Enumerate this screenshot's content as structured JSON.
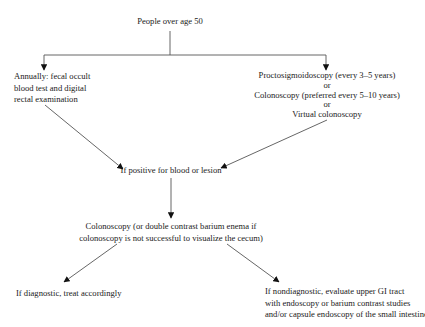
{
  "diagram": {
    "type": "flowchart",
    "colors": {
      "background": "#ffffff",
      "text": "#1a1a1a",
      "edge": "#555555",
      "arrowhead": "#111111"
    },
    "nodes": {
      "root": {
        "lines": [
          "People over age 50"
        ]
      },
      "annual": {
        "lines": [
          "Annually: fecal occult",
          "blood test and digital",
          "rectal examination"
        ]
      },
      "endoscopy_options": {
        "lines": [
          "Proctosigmoidoscopy (every 3–5 years)",
          "or",
          "Colonoscopy (preferred every 5–10 years)",
          "or",
          "Virtual colonoscopy"
        ]
      },
      "positive": {
        "lines": [
          "If positive for blood or lesion"
        ]
      },
      "colonoscopy": {
        "lines": [
          "Colonoscopy (or double contrast barium enema if",
          "colonoscopy is not successful to visualize the cecum)"
        ]
      },
      "diagnostic": {
        "lines": [
          "If diagnostic, treat accordingly"
        ]
      },
      "nondiagnostic": {
        "lines": [
          "If nondiagnostic, evaluate upper GI tract",
          "with endoscopy or barium contrast studies",
          "and/or capsule endoscopy of the small intestine"
        ]
      }
    },
    "edges": [
      {
        "from": "root",
        "to": "annual"
      },
      {
        "from": "root",
        "to": "endoscopy_options"
      },
      {
        "from": "annual",
        "to": "positive"
      },
      {
        "from": "endoscopy_options",
        "to": "positive"
      },
      {
        "from": "positive",
        "to": "colonoscopy"
      },
      {
        "from": "colonoscopy",
        "to": "diagnostic"
      },
      {
        "from": "colonoscopy",
        "to": "nondiagnostic"
      }
    ]
  }
}
